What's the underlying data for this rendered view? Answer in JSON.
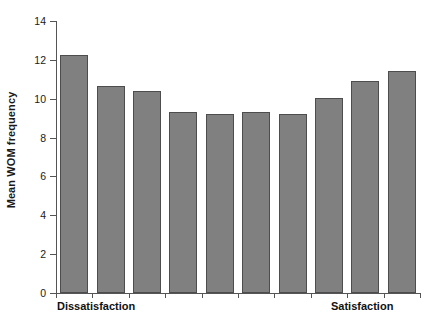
{
  "chart_data": {
    "type": "bar",
    "title": "",
    "subtitle": "",
    "xlabel": "",
    "ylabel": "Mean WOM frequency",
    "ylim": [
      0,
      14
    ],
    "yticks": [
      0,
      2,
      4,
      6,
      8,
      10,
      12,
      14
    ],
    "ytick_labels": [
      "0",
      "2",
      "4",
      "6",
      "8",
      "10",
      "12",
      "14"
    ],
    "grid": false,
    "legend": null,
    "legend_position": "none",
    "categories": [
      "1",
      "2",
      "3",
      "4",
      "5",
      "6",
      "7",
      "8",
      "9",
      "10"
    ],
    "xtick_labels": [
      "",
      "",
      "",
      "",
      "",
      "",
      "",
      "",
      "",
      ""
    ],
    "x_end_labels": {
      "left": "Dissatisfaction",
      "right": "Satisfaction"
    },
    "values": [
      12.25,
      10.65,
      10.4,
      9.3,
      9.2,
      9.3,
      9.2,
      10.05,
      10.9,
      11.45
    ],
    "bar_color": "#808080",
    "bar_edge_color": "#4d4d4d",
    "axis_color": "#555555",
    "background_color": "#ffffff"
  }
}
